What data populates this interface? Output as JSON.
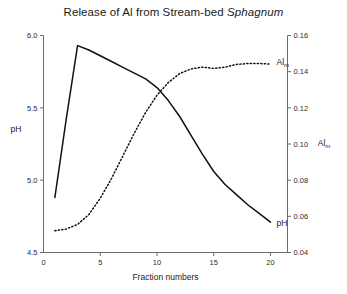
{
  "chart_data": {
    "type": "line",
    "title": "Release of Al from Stream-bed Sphagnum",
    "title_plain": "Release of Al from Stream-bed ",
    "title_italic": "Sphagnum",
    "xlabel": "Fraction numbers",
    "ylabel": "pH",
    "ylabel_right": "Alm",
    "ylabel_right_base": "Al",
    "ylabel_right_sub": "m",
    "grid": false,
    "legend_position": "inline-end-of-series",
    "xlim": [
      0,
      21.5
    ],
    "ylim": [
      4.5,
      6.0
    ],
    "ylim_right": [
      0.04,
      0.16
    ],
    "xticks": [
      0,
      5,
      10,
      15,
      20
    ],
    "xticklabels": [
      "0",
      "5",
      "10",
      "15",
      "20"
    ],
    "yticks": [
      4.5,
      5.0,
      5.5,
      6.0
    ],
    "yticklabels": [
      "4.5",
      "5.0",
      "5.5",
      "6.0"
    ],
    "yticks_right": [
      0.04,
      0.06,
      0.08,
      0.1,
      0.12,
      0.14,
      0.16
    ],
    "yticklabels_right": [
      "0.04",
      "0.06",
      "0.08",
      "0.10",
      "0.12",
      "0.14",
      "0.16"
    ],
    "series": [
      {
        "name": "pH",
        "axis": "left",
        "style": "solid",
        "label": "pH",
        "x": [
          1,
          2,
          3,
          4,
          5,
          6,
          7,
          8,
          9,
          10,
          11,
          12,
          13,
          14,
          15,
          16,
          17,
          18,
          19,
          20
        ],
        "values": [
          4.88,
          5.42,
          5.93,
          5.9,
          5.86,
          5.82,
          5.78,
          5.74,
          5.7,
          5.64,
          5.55,
          5.44,
          5.31,
          5.18,
          5.06,
          4.97,
          4.9,
          4.83,
          4.77,
          4.71
        ]
      },
      {
        "name": "Alm",
        "axis": "right",
        "style": "dotted",
        "label": "Alm",
        "label_base": "Al",
        "label_sub": "m",
        "x": [
          1,
          2,
          3,
          4,
          5,
          6,
          7,
          8,
          9,
          10,
          11,
          12,
          13,
          14,
          15,
          16,
          17,
          18,
          19,
          20
        ],
        "values": [
          0.052,
          0.053,
          0.0555,
          0.061,
          0.07,
          0.081,
          0.0935,
          0.106,
          0.1175,
          0.127,
          0.134,
          0.139,
          0.1415,
          0.1425,
          0.1418,
          0.1425,
          0.144,
          0.1445,
          0.1445,
          0.1442
        ]
      }
    ]
  }
}
